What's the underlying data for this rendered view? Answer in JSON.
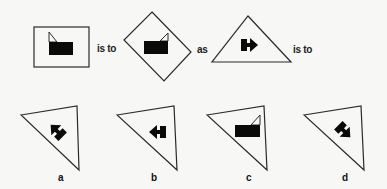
{
  "puzzle": {
    "type": "figure analogy",
    "connectors": {
      "is_to_1": "is to",
      "as": "as",
      "is_to_2": "is to"
    },
    "stem": [
      {
        "id": "figure-1",
        "outer_shape": "rectangle",
        "inner_symbol": "black rectangle with triangular flag",
        "orientation": "upright"
      },
      {
        "id": "figure-2",
        "outer_shape": "diamond (rotated square)",
        "inner_symbol": "black rectangle with triangular flag",
        "orientation": "flag on right"
      },
      {
        "id": "figure-3",
        "outer_shape": "triangle",
        "inner_symbol": "block with arrow",
        "orientation": "arrow pointing right"
      }
    ],
    "options": [
      {
        "label": "a",
        "outer_shape": "rotated triangle",
        "inner_symbol": "block with arrow",
        "orientation": "arrow pointing up-left"
      },
      {
        "label": "b",
        "outer_shape": "rotated triangle",
        "inner_symbol": "block with arrow",
        "orientation": "arrow pointing left"
      },
      {
        "label": "c",
        "outer_shape": "rotated triangle",
        "inner_symbol": "black rectangle with triangular flag",
        "orientation": "flag on right"
      },
      {
        "label": "d",
        "outer_shape": "rotated triangle",
        "inner_symbol": "block with arrow",
        "orientation": "arrow pointing down-right"
      }
    ]
  }
}
